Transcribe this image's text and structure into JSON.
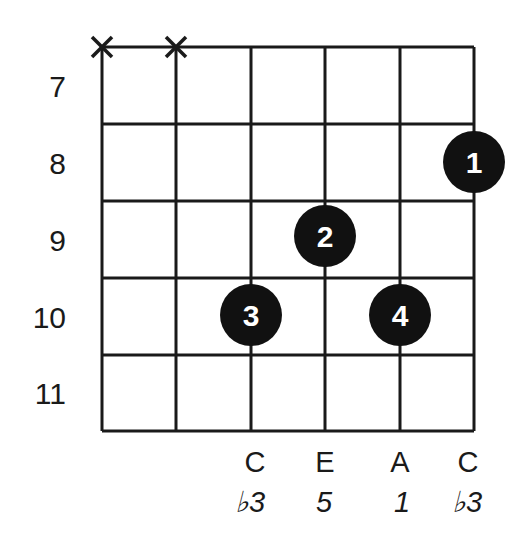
{
  "diagram": {
    "type": "guitar-chord-chart",
    "strings": 6,
    "frets_shown": [
      7,
      8,
      9,
      10,
      11
    ],
    "fret_labels": [
      "7",
      "8",
      "9",
      "10",
      "11"
    ],
    "muted_strings": [
      1,
      2
    ],
    "muted_symbol": "X",
    "fingerings": [
      {
        "finger": "1",
        "string": 6,
        "fret": 8
      },
      {
        "finger": "2",
        "string": 4,
        "fret": 9
      },
      {
        "finger": "3",
        "string": 3,
        "fret": 10
      },
      {
        "finger": "4",
        "string": 5,
        "fret": 10
      }
    ],
    "note_labels": [
      {
        "string": 3,
        "note": "C",
        "interval": "♭3"
      },
      {
        "string": 4,
        "note": "E",
        "interval": "5"
      },
      {
        "string": 5,
        "note": "A",
        "interval": "1"
      },
      {
        "string": 6,
        "note": "C",
        "interval": "♭3"
      }
    ],
    "colors": {
      "line": "#1a1a1a",
      "dot": "#111111",
      "dot_text": "#ffffff",
      "background": "#ffffff"
    }
  }
}
